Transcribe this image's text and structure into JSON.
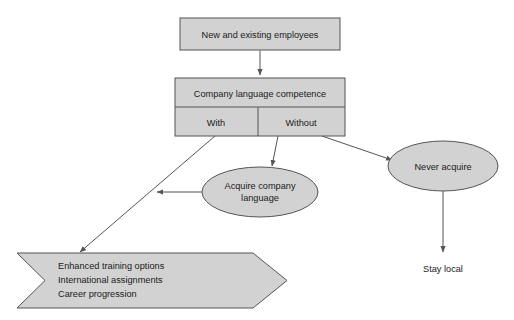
{
  "diagram": {
    "colors": {
      "shape_fill": "#d2d2d2",
      "shape_stroke": "#555555",
      "text": "#1a1a1a",
      "background": "#ffffff"
    },
    "nodes": {
      "employees_box": {
        "label": "New and existing employees",
        "shape": "rectangle"
      },
      "competence_box": {
        "label": "Company language competence",
        "shape": "rectangle"
      },
      "with_cell": {
        "label": "With",
        "shape": "rectangle-cell"
      },
      "without_cell": {
        "label": "Without",
        "shape": "rectangle-cell"
      },
      "acquire_ellipse": {
        "label_line1": "Acquire company",
        "label_line2": "language",
        "shape": "ellipse"
      },
      "never_acquire_ellipse": {
        "label": "Never acquire",
        "shape": "ellipse"
      },
      "outcomes_banner": {
        "label_line1": "Enhanced training options",
        "label_line2": "International assignments",
        "label_line3": "Career progression",
        "shape": "banner-arrow"
      },
      "stay_local_label": {
        "label": "Stay local",
        "shape": "text"
      }
    },
    "connectors": [
      {
        "name": "employees-to-competence",
        "from": "employees_box",
        "to": "competence_box",
        "arrow": true
      },
      {
        "name": "with-to-outcomes",
        "from": "with_cell",
        "to": "outcomes_banner",
        "arrow": true
      },
      {
        "name": "without-to-acquire",
        "from": "without_cell",
        "to": "acquire_ellipse",
        "arrow": true
      },
      {
        "name": "without-to-never-acquire",
        "from": "without_cell",
        "to": "never_acquire_ellipse",
        "arrow": true
      },
      {
        "name": "acquire-to-with-path",
        "from": "acquire_ellipse",
        "to": "with-to-outcomes",
        "arrow": true
      },
      {
        "name": "never-acquire-to-stay-local",
        "from": "never_acquire_ellipse",
        "to": "stay_local_label",
        "arrow": true
      }
    ]
  }
}
